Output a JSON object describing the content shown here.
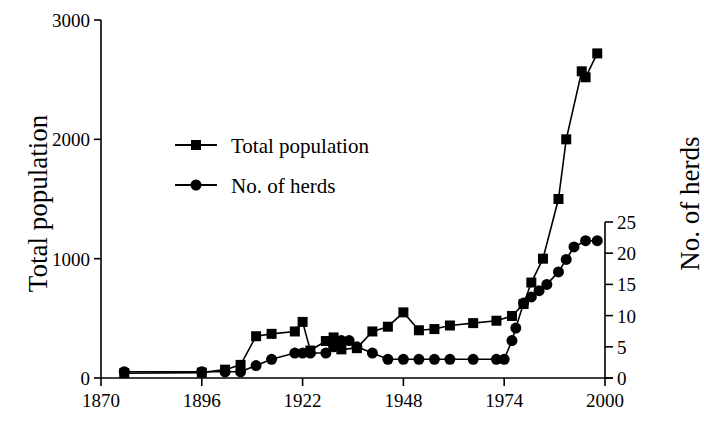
{
  "chart_data": {
    "type": "line",
    "title": "",
    "xlabel": "",
    "ylabel": "Total population",
    "y2label": "No. of herds",
    "xlim": [
      1870,
      2000
    ],
    "ylim": [
      0,
      3000
    ],
    "y2lim": [
      0,
      25
    ],
    "grid": false,
    "legend_position": "upper-left-inside",
    "xticks": [
      1870,
      1896,
      1922,
      1948,
      1974,
      2000
    ],
    "xtick_labels": [
      "1870",
      "1896",
      "1922",
      "1948",
      "1974",
      "2000"
    ],
    "yticks": [
      0,
      1000,
      2000,
      3000
    ],
    "ytick_labels": [
      "0",
      "1000",
      "2000",
      "3000"
    ],
    "y2ticks": [
      0,
      5,
      10,
      15,
      20,
      25
    ],
    "y2tick_labels": [
      "0",
      "5",
      "10",
      "15",
      "20",
      "25"
    ],
    "series": [
      {
        "name": "Total population",
        "axis": "left",
        "marker": "square",
        "color": "#000000",
        "points": [
          [
            1876,
            40
          ],
          [
            1896,
            45
          ],
          [
            1902,
            70
          ],
          [
            1906,
            110
          ],
          [
            1910,
            350
          ],
          [
            1914,
            370
          ],
          [
            1920,
            390
          ],
          [
            1922,
            470
          ],
          [
            1924,
            230
          ],
          [
            1928,
            310
          ],
          [
            1930,
            340
          ],
          [
            1932,
            240
          ],
          [
            1936,
            250
          ],
          [
            1940,
            390
          ],
          [
            1944,
            430
          ],
          [
            1948,
            550
          ],
          [
            1952,
            400
          ],
          [
            1956,
            410
          ],
          [
            1960,
            440
          ],
          [
            1966,
            460
          ],
          [
            1972,
            480
          ],
          [
            1976,
            520
          ],
          [
            1979,
            620
          ],
          [
            1981,
            800
          ],
          [
            1984,
            1000
          ],
          [
            1988,
            1500
          ],
          [
            1990,
            2000
          ],
          [
            1994,
            2570
          ],
          [
            1995,
            2520
          ],
          [
            1998,
            2720
          ]
        ]
      },
      {
        "name": "No. of herds",
        "axis": "right",
        "marker": "circle",
        "color": "#000000",
        "points": [
          [
            1876,
            1
          ],
          [
            1896,
            1
          ],
          [
            1902,
            1
          ],
          [
            1906,
            1
          ],
          [
            1910,
            2
          ],
          [
            1914,
            3
          ],
          [
            1920,
            4
          ],
          [
            1922,
            4
          ],
          [
            1924,
            4
          ],
          [
            1928,
            4
          ],
          [
            1930,
            5
          ],
          [
            1932,
            6
          ],
          [
            1934,
            6
          ],
          [
            1936,
            5
          ],
          [
            1940,
            4
          ],
          [
            1944,
            3
          ],
          [
            1948,
            3
          ],
          [
            1952,
            3
          ],
          [
            1956,
            3
          ],
          [
            1960,
            3
          ],
          [
            1966,
            3
          ],
          [
            1972,
            3
          ],
          [
            1974,
            3
          ],
          [
            1976,
            6
          ],
          [
            1977,
            8
          ],
          [
            1979,
            12
          ],
          [
            1981,
            13
          ],
          [
            1983,
            14
          ],
          [
            1985,
            15
          ],
          [
            1988,
            17
          ],
          [
            1990,
            19
          ],
          [
            1992,
            21
          ],
          [
            1995,
            22
          ],
          [
            1998,
            22
          ]
        ]
      }
    ],
    "legend": [
      {
        "label": "Total population",
        "marker": "square"
      },
      {
        "label": "No. of herds",
        "marker": "circle"
      }
    ]
  }
}
